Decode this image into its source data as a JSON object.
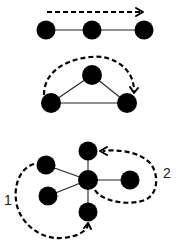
{
  "diagram": {
    "panels": [
      {
        "name": "line-graph",
        "nodes": [
          {
            "id": "a",
            "x": 46,
            "y": 30
          },
          {
            "id": "b",
            "x": 92,
            "y": 30
          },
          {
            "id": "c",
            "x": 144,
            "y": 30
          }
        ],
        "edges": [
          [
            "a",
            "b"
          ],
          [
            "b",
            "c"
          ]
        ],
        "path_arrow": "dashed straight arrow left to right above nodes"
      },
      {
        "name": "triangle-graph",
        "nodes": [
          {
            "id": "top",
            "x": 92,
            "y": 75
          },
          {
            "id": "left",
            "x": 51,
            "y": 103
          },
          {
            "id": "right",
            "x": 127,
            "y": 103
          }
        ],
        "edges": [
          [
            "top",
            "left"
          ],
          [
            "top",
            "right"
          ],
          [
            "left",
            "right"
          ]
        ],
        "path_arrow": "dashed arc from left node over top to right node"
      },
      {
        "name": "star-graph",
        "nodes": [
          {
            "id": "center",
            "x": 88,
            "y": 180
          },
          {
            "id": "top",
            "x": 88,
            "y": 151
          },
          {
            "id": "right",
            "x": 130,
            "y": 180
          },
          {
            "id": "bottom",
            "x": 88,
            "y": 212
          },
          {
            "id": "upper-left",
            "x": 46,
            "y": 165
          },
          {
            "id": "lower-left",
            "x": 48,
            "y": 196
          }
        ],
        "edges": [
          [
            "center",
            "top"
          ],
          [
            "center",
            "right"
          ],
          [
            "center",
            "bottom"
          ],
          [
            "center",
            "upper-left"
          ],
          [
            "center",
            "lower-left"
          ]
        ],
        "path_arrows": [
          {
            "label": "1",
            "description": "dashed curve from upper-left node around left side to bottom node"
          },
          {
            "label": "2",
            "description": "dashed loop from center node around right node back to top node"
          }
        ]
      }
    ],
    "labels": {
      "path1": "1",
      "path2": "2"
    },
    "colors": {
      "node": "#000000",
      "edge": "#222222",
      "background": "#ffffff"
    }
  }
}
